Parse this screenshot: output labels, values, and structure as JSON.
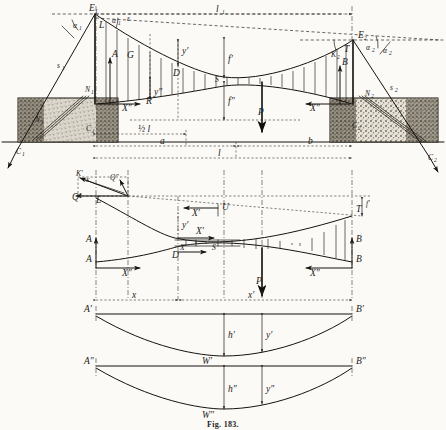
{
  "figure": {
    "caption": "Fig. 183.",
    "title": "Fig. 183."
  },
  "colors": {
    "ink": "#16130f",
    "paper": "#fbfaf7",
    "dash": "#2a2620",
    "masonry_fill": "#b9b2a6",
    "masonry_light": "#e8e4db"
  },
  "panels": {
    "top": {
      "name": "elevation-with-anchorages",
      "labels": {
        "tower_left": "E",
        "tower_left_sub": "1",
        "tower_right": "E",
        "tower_right_sub": "2",
        "backstay_left": "s",
        "backstay_left_sub": "1",
        "backstay_right": "s",
        "backstay_right_sub": "2",
        "angle_left_outer": "α",
        "angle_left_outer_sub": "1",
        "angle_left_inner": "α",
        "angle_left_inner_sub": "1",
        "angle_left_eps": "ε",
        "angle_right_inner": "α",
        "angle_right_inner_sub": "2",
        "angle_right_outer": "α",
        "angle_right_outer_sub": "2",
        "saddle_left": "L",
        "saddle_right": "T",
        "anchor_left_force": "N",
        "anchor_left_force_sub": "1",
        "anchor_left_ground": "C",
        "anchor_left_ground_sub": "1",
        "anchor_left_inner": "N",
        "anchor_left_inner_sub": "1",
        "anchor_right_force": "N",
        "anchor_right_force_sub": "2",
        "anchor_right_ground": "C",
        "anchor_right_ground_sub": "2",
        "pier_left": "A",
        "pier_right": "B",
        "thrust_left": "X″",
        "thrust_right": "X″",
        "node_G": "G",
        "node_R": "R",
        "node_D": "D",
        "node_S": "S",
        "node_K_left": "K",
        "node_K_left_sub": "1",
        "node_K_right": "K",
        "node_K_right_sub": "2",
        "load_P": "P",
        "span_l1": "l",
        "span_l1_sub": "1",
        "dip_upper": "f′",
        "dip_lower": "f″",
        "ordinate_y_upper": "y′",
        "ordinate_y_lower": "y″",
        "dim_half_l": "½ l",
        "dim_a": "a",
        "dim_b": "b",
        "dim_l": "l"
      }
    },
    "middle": {
      "name": "force-polygon-and-cable-system",
      "labels": {
        "pole_K": "K",
        "pole_K_prime": "K′",
        "ray_Q_prime": "Q′",
        "ray_Q_double": "Q″",
        "saddle_L": "L",
        "saddle_T": "T",
        "pier_A": "A",
        "pier_B": "B",
        "node_D": "D",
        "node_S": "S",
        "node_U": "U",
        "force_X_prime": "X′",
        "force_X_prime2": "X′",
        "force_X_prime3": "X′",
        "force_X_double_left": "X″",
        "force_X_double_right": "X″",
        "ordinate_y_prime": "y′",
        "ordinate_y_double": "y″",
        "dip_f_prime": "f′",
        "load_P": "P",
        "dim_x": "x",
        "dim_x_prime": "x′"
      }
    },
    "lower1": {
      "name": "influence-diagram-upper",
      "labels": {
        "left_support": "A′",
        "right_support": "B′",
        "mid_ordinate": "h′",
        "ordinate": "y′",
        "curve_label": "W′"
      }
    },
    "lower2": {
      "name": "influence-diagram-lower",
      "labels": {
        "left_support": "A″",
        "right_support": "B″",
        "mid_ordinate": "h″",
        "ordinate": "y″",
        "curve_label": "W″"
      }
    }
  }
}
